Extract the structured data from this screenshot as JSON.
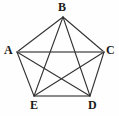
{
  "figure": {
    "kind": "geometry-diagram",
    "background_color": "#fefefe",
    "edge_color": "#333333",
    "accent_edge_color": "#8a8a8a",
    "label_color": "#1a1a1a",
    "vertices": [
      {
        "id": "A",
        "label": "A",
        "x": 17,
        "y": 52,
        "label_x": 4,
        "label_y": 44
      },
      {
        "id": "B",
        "label": "B",
        "x": 63,
        "y": 17,
        "label_x": 58,
        "label_y": 1
      },
      {
        "id": "C",
        "label": "C",
        "x": 104,
        "y": 52,
        "label_x": 106,
        "label_y": 44
      },
      {
        "id": "D",
        "label": "D",
        "x": 90,
        "y": 96,
        "label_x": 88,
        "label_y": 99
      },
      {
        "id": "E",
        "label": "E",
        "x": 34,
        "y": 96,
        "label_x": 30,
        "label_y": 99
      }
    ],
    "sides": [
      {
        "from": "A",
        "to": "B",
        "style": "thin-dark"
      },
      {
        "from": "B",
        "to": "C",
        "style": "thin-dark"
      },
      {
        "from": "C",
        "to": "D",
        "style": "thin-dark"
      },
      {
        "from": "D",
        "to": "E",
        "style": "thick-gray"
      },
      {
        "from": "E",
        "to": "A",
        "style": "thin-dark"
      }
    ],
    "diagonals": [
      {
        "from": "A",
        "to": "C",
        "style": "thick-gray"
      },
      {
        "from": "A",
        "to": "D",
        "style": "thin-dark"
      },
      {
        "from": "B",
        "to": "D",
        "style": "thin-dark"
      },
      {
        "from": "B",
        "to": "E",
        "style": "thin-dark"
      },
      {
        "from": "C",
        "to": "E",
        "style": "thin-dark"
      }
    ],
    "labels": {
      "A": "A",
      "B": "B",
      "C": "C",
      "D": "D",
      "E": "E"
    }
  }
}
